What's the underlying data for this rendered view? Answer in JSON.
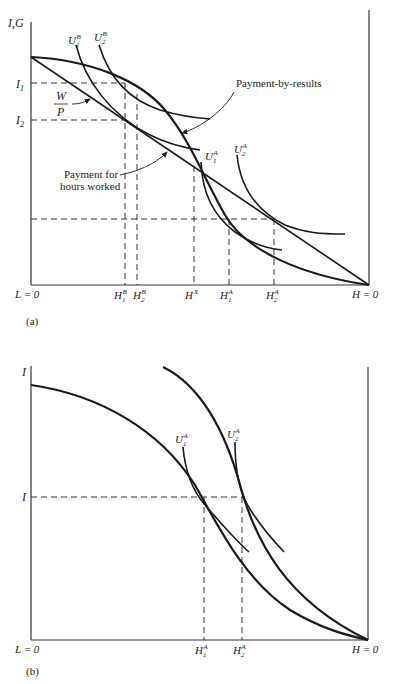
{
  "panel_a": {
    "caption": "(a)",
    "y_axis_label": "I,G",
    "x_left_label": "L = 0",
    "x_right_label": "H = 0",
    "y_ticks": {
      "I1": {
        "base": "I",
        "sub": "1"
      },
      "I2": {
        "base": "I",
        "sub": "2"
      }
    },
    "wage_label": {
      "num": "W",
      "den": "P"
    },
    "curve_labels": {
      "U1B": {
        "base": "U",
        "sub": "1",
        "sup": "B"
      },
      "U2B": {
        "base": "U",
        "sub": "2",
        "sup": "B"
      },
      "U1A": {
        "base": "U",
        "sub": "1",
        "sup": "A"
      },
      "U2A": {
        "base": "U",
        "sub": "2",
        "sup": "A"
      }
    },
    "annotations": {
      "payment_by_results": "Payment-by-results",
      "payment_hours_line1": "Payment for",
      "payment_hours_line2": "hours worked"
    },
    "x_ticks": {
      "H1B": {
        "base": "H",
        "sub": "1",
        "sup": "B"
      },
      "H2B": {
        "base": "H",
        "sub": "2",
        "sup": "B"
      },
      "HX": {
        "base": "H",
        "sup": "X"
      },
      "H1A": {
        "base": "H",
        "sub": "1",
        "sup": "A"
      },
      "H2A": {
        "base": "H",
        "sub": "2",
        "sup": "A"
      }
    }
  },
  "panel_b": {
    "caption": "(b)",
    "y_axis_label": "I",
    "y_tick": "I",
    "x_left_label": "L = 0",
    "x_right_label": "H = 0",
    "curve_labels": {
      "U1A": {
        "base": "U",
        "sub": "1",
        "sup": "A"
      },
      "U2A": {
        "base": "U",
        "sub": "2",
        "sup": "A"
      }
    },
    "x_ticks": {
      "H1A": {
        "base": "H",
        "sub": "1",
        "sup": "A"
      },
      "H2A": {
        "base": "H",
        "sub": "2",
        "sup": "A"
      }
    }
  }
}
